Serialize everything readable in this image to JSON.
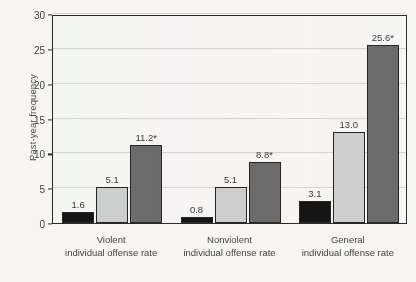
{
  "chart_data": {
    "type": "bar",
    "title": "",
    "xlabel": "",
    "ylabel": "Past-year frequency",
    "ylim": [
      0,
      30
    ],
    "yticks": [
      "0",
      "5",
      "10",
      "15",
      "20",
      "25",
      "30"
    ],
    "grid": true,
    "legend": "none",
    "categories": [
      "Violent individual offense rate",
      "Nonviolent individual offense rate",
      "General individual offense rate"
    ],
    "category_lines": [
      {
        "line1": "Violent",
        "line2": "individual offense rate"
      },
      {
        "line1": "Nonviolent",
        "line2": "individual offense rate"
      },
      {
        "line1": "General",
        "line2": "individual offense rate"
      }
    ],
    "series": [
      {
        "name": "series-1",
        "color": "#151515",
        "values": [
          1.6,
          0.8,
          3.1
        ],
        "labels": [
          "1.6",
          "0.8",
          "3.1"
        ]
      },
      {
        "name": "series-2",
        "color": "#d2d2d2",
        "values": [
          5.1,
          5.1,
          13.0
        ],
        "labels": [
          "5.1",
          "5.1",
          "13.0"
        ]
      },
      {
        "name": "series-3",
        "color": "#6e6e6e",
        "values": [
          11.2,
          8.8,
          25.6
        ],
        "labels": [
          "11.2*",
          "8.8*",
          "25.6*"
        ]
      }
    ],
    "annotations": {
      "significance_marker": "*"
    }
  },
  "figure": {
    "background_color": "#f7f6f2",
    "axis_color": "#2b2b2b",
    "gridline_color": "#d8d8d4"
  }
}
